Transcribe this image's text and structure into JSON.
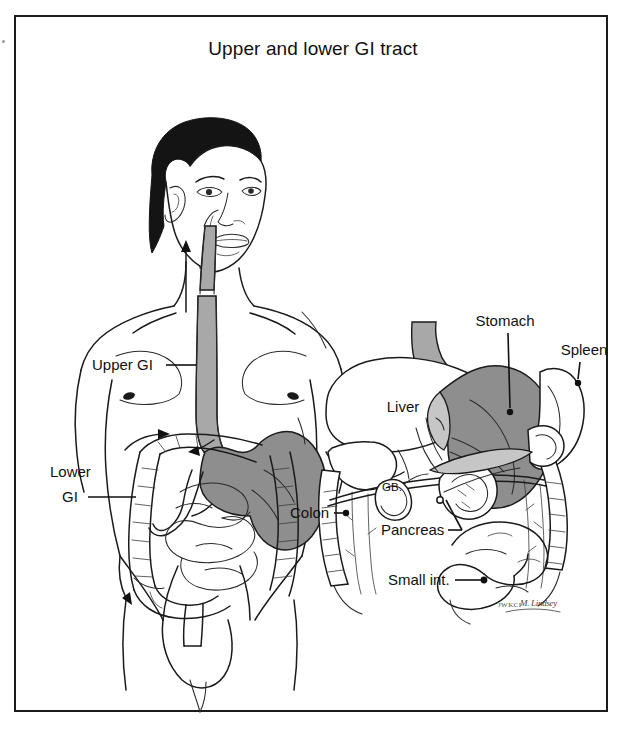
{
  "figure": {
    "title": "Upper and lower GI tract",
    "border_color": "#1c1c1c",
    "background": "#ffffff"
  },
  "palette": {
    "ink": "#1a1a1a",
    "stomach_gray": "#8e8e8e",
    "esophagus_gray": "#a8a8a8",
    "duodenum_gray": "#c6c6c6",
    "organ_white": "#ffffff",
    "label_text": "#111111"
  },
  "panels": [
    {
      "id": "left-panel",
      "name": "whole-body-gi-overview",
      "description": "Male torso with head, showing esophagus, stomach, small intestine and colon",
      "labels": [
        {
          "key": "upper_gi",
          "text": "Upper GI",
          "x": 92,
          "y": 365,
          "anchor": "start",
          "leader_to_x": 196,
          "leader_to_y": 365
        },
        {
          "key": "lower_gi_line1",
          "text": "Lower",
          "x": 50,
          "y": 477,
          "anchor": "start"
        },
        {
          "key": "lower_gi_line2",
          "text": "GI",
          "x": 62,
          "y": 500,
          "anchor": "start",
          "leader_to_x": 136,
          "leader_to_y": 497
        }
      ]
    },
    {
      "id": "right-panel",
      "name": "upper-abdomen-organ-detail",
      "description": "Close-up of upper abdominal organs: liver, stomach, spleen, pancreas, gallbladder, colon and small intestine",
      "labels": [
        {
          "key": "stomach",
          "text": "Stomach",
          "x": 505,
          "y": 326,
          "anchor": "middle",
          "dot_x": 510,
          "dot_y": 412
        },
        {
          "key": "spleen",
          "text": "Spleen",
          "x": 584,
          "y": 355,
          "anchor": "middle",
          "dot_x": 578,
          "dot_y": 383
        },
        {
          "key": "liver",
          "text": "Liver",
          "x": 403,
          "y": 408,
          "anchor": "middle"
        },
        {
          "key": "gallbladder",
          "text": "GB.",
          "x": 392,
          "y": 487,
          "anchor": "middle"
        },
        {
          "key": "colon",
          "text": "Colon",
          "x": 290,
          "y": 518,
          "anchor": "start",
          "dot_x": 345,
          "dot_y": 513
        },
        {
          "key": "pancreas",
          "text": "Pancreas",
          "x": 381,
          "y": 535,
          "anchor": "start",
          "dot_x": 462,
          "dot_y": 530
        },
        {
          "key": "small_intestine",
          "text": "Small int.",
          "x": 388,
          "y": 585,
          "anchor": "start",
          "dot_x": 484,
          "dot_y": 580
        }
      ]
    }
  ],
  "signature": {
    "mark": "JWKCI",
    "name": "M. Lindsey"
  }
}
